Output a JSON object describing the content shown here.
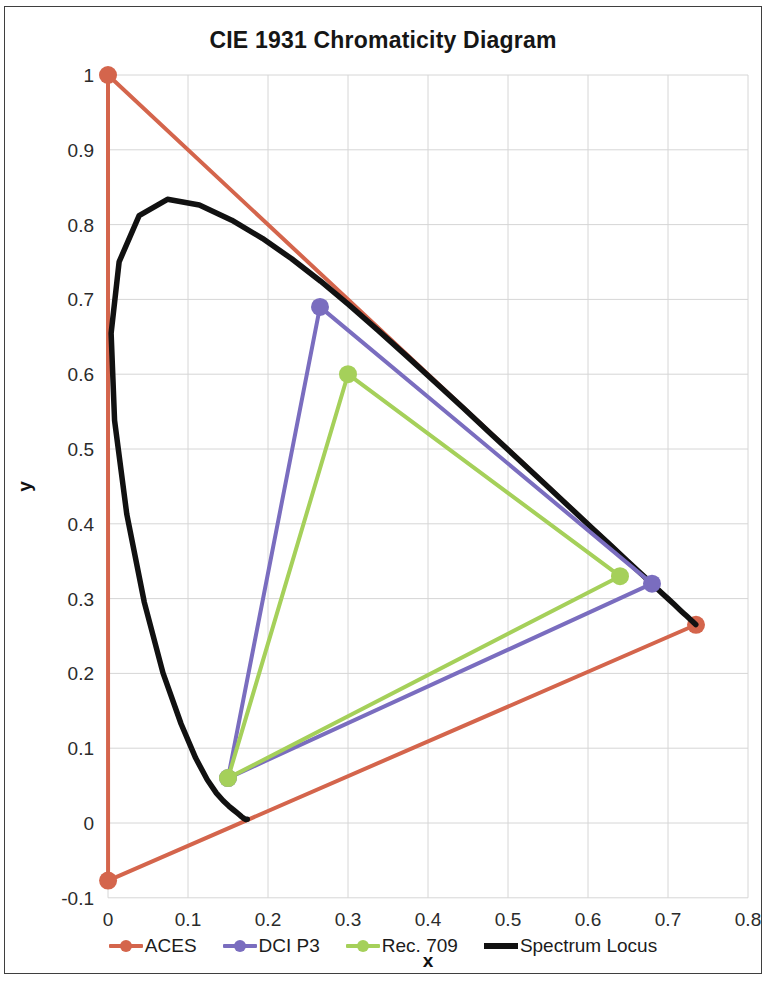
{
  "chart_data": {
    "type": "line",
    "title": "CIE 1931 Chromaticity Diagram",
    "xlabel": "x",
    "ylabel": "y",
    "xlim": [
      0,
      0.8
    ],
    "ylim": [
      -0.1,
      1.0
    ],
    "xticks": [
      "0",
      "0.1",
      "0.2",
      "0.3",
      "0.4",
      "0.5",
      "0.6",
      "0.7",
      "0.8"
    ],
    "yticks": [
      "-0.1",
      "0",
      "0.1",
      "0.2",
      "0.3",
      "0.4",
      "0.5",
      "0.6",
      "0.7",
      "0.8",
      "0.9",
      "1"
    ],
    "xtick_values": [
      0,
      0.1,
      0.2,
      0.3,
      0.4,
      0.5,
      0.6,
      0.7,
      0.8
    ],
    "ytick_values": [
      -0.1,
      0,
      0.1,
      0.2,
      0.3,
      0.4,
      0.5,
      0.6,
      0.7,
      0.8,
      0.9,
      1
    ],
    "grid": true,
    "legend_position": "bottom",
    "series": [
      {
        "name": "ACES",
        "color": "#D4654C",
        "marker": "circle",
        "closed": true,
        "points": [
          {
            "label": "red",
            "x": 0.735,
            "y": 0.265
          },
          {
            "label": "green",
            "x": 0.0,
            "y": 1.0
          },
          {
            "label": "blue",
            "x": 0.0001,
            "y": -0.077
          }
        ]
      },
      {
        "name": "DCI P3",
        "color": "#7A6DBF",
        "marker": "circle",
        "closed": true,
        "points": [
          {
            "label": "red",
            "x": 0.68,
            "y": 0.32
          },
          {
            "label": "green",
            "x": 0.265,
            "y": 0.69
          },
          {
            "label": "blue",
            "x": 0.15,
            "y": 0.06
          }
        ]
      },
      {
        "name": "Rec. 709",
        "color": "#A5D05A",
        "marker": "circle",
        "closed": true,
        "points": [
          {
            "label": "red",
            "x": 0.64,
            "y": 0.33
          },
          {
            "label": "green",
            "x": 0.3,
            "y": 0.6
          },
          {
            "label": "blue",
            "x": 0.15,
            "y": 0.06
          }
        ]
      },
      {
        "name": "Spectrum Locus",
        "color": "#111111",
        "marker": "none",
        "closed": false,
        "points": [
          {
            "x": 0.1741,
            "y": 0.005
          },
          {
            "x": 0.174,
            "y": 0.005
          },
          {
            "x": 0.1738,
            "y": 0.0049
          },
          {
            "x": 0.1736,
            "y": 0.0049
          },
          {
            "x": 0.1733,
            "y": 0.0048
          },
          {
            "x": 0.173,
            "y": 0.0048
          },
          {
            "x": 0.1726,
            "y": 0.0048
          },
          {
            "x": 0.1721,
            "y": 0.0048
          },
          {
            "x": 0.1714,
            "y": 0.0051
          },
          {
            "x": 0.1703,
            "y": 0.0058
          },
          {
            "x": 0.1689,
            "y": 0.0069
          },
          {
            "x": 0.1669,
            "y": 0.0086
          },
          {
            "x": 0.1644,
            "y": 0.0109
          },
          {
            "x": 0.1611,
            "y": 0.0138
          },
          {
            "x": 0.1566,
            "y": 0.0177
          },
          {
            "x": 0.151,
            "y": 0.0227
          },
          {
            "x": 0.144,
            "y": 0.0297
          },
          {
            "x": 0.1355,
            "y": 0.0399
          },
          {
            "x": 0.1241,
            "y": 0.0578
          },
          {
            "x": 0.1096,
            "y": 0.0868
          },
          {
            "x": 0.0913,
            "y": 0.1327
          },
          {
            "x": 0.0687,
            "y": 0.2007
          },
          {
            "x": 0.0454,
            "y": 0.295
          },
          {
            "x": 0.0235,
            "y": 0.4127
          },
          {
            "x": 0.0082,
            "y": 0.5384
          },
          {
            "x": 0.0039,
            "y": 0.6548
          },
          {
            "x": 0.0139,
            "y": 0.7502
          },
          {
            "x": 0.0389,
            "y": 0.812
          },
          {
            "x": 0.0743,
            "y": 0.8338
          },
          {
            "x": 0.1142,
            "y": 0.8262
          },
          {
            "x": 0.1547,
            "y": 0.8059
          },
          {
            "x": 0.1929,
            "y": 0.7816
          },
          {
            "x": 0.2296,
            "y": 0.7543
          },
          {
            "x": 0.2658,
            "y": 0.7243
          },
          {
            "x": 0.3016,
            "y": 0.6923
          },
          {
            "x": 0.3373,
            "y": 0.6589
          },
          {
            "x": 0.3731,
            "y": 0.6245
          },
          {
            "x": 0.4087,
            "y": 0.5896
          },
          {
            "x": 0.4441,
            "y": 0.5547
          },
          {
            "x": 0.4788,
            "y": 0.5202
          },
          {
            "x": 0.5125,
            "y": 0.4866
          },
          {
            "x": 0.5448,
            "y": 0.4544
          },
          {
            "x": 0.5752,
            "y": 0.4242
          },
          {
            "x": 0.6029,
            "y": 0.3965
          },
          {
            "x": 0.627,
            "y": 0.3725
          },
          {
            "x": 0.6482,
            "y": 0.3514
          },
          {
            "x": 0.6658,
            "y": 0.334
          },
          {
            "x": 0.6801,
            "y": 0.3197
          },
          {
            "x": 0.6915,
            "y": 0.3083
          },
          {
            "x": 0.7006,
            "y": 0.2993
          },
          {
            "x": 0.7079,
            "y": 0.292
          },
          {
            "x": 0.714,
            "y": 0.2859
          },
          {
            "x": 0.719,
            "y": 0.2809
          },
          {
            "x": 0.723,
            "y": 0.277
          },
          {
            "x": 0.726,
            "y": 0.274
          },
          {
            "x": 0.7283,
            "y": 0.2717
          },
          {
            "x": 0.73,
            "y": 0.27
          },
          {
            "x": 0.7311,
            "y": 0.2689
          },
          {
            "x": 0.732,
            "y": 0.268
          },
          {
            "x": 0.7327,
            "y": 0.2673
          },
          {
            "x": 0.7334,
            "y": 0.2666
          },
          {
            "x": 0.734,
            "y": 0.266
          },
          {
            "x": 0.7344,
            "y": 0.2656
          },
          {
            "x": 0.7346,
            "y": 0.2654
          },
          {
            "x": 0.7347,
            "y": 0.2653
          }
        ]
      }
    ]
  },
  "legend": {
    "items": [
      {
        "label": "ACES",
        "color": "#D4654C",
        "style": "line-marker"
      },
      {
        "label": "DCI P3",
        "color": "#7A6DBF",
        "style": "line-marker"
      },
      {
        "label": "Rec. 709",
        "color": "#A5D05A",
        "style": "line-marker"
      },
      {
        "label": "Spectrum Locus",
        "color": "#111111",
        "style": "line"
      }
    ]
  },
  "colors": {
    "aces": "#D4654C",
    "dci_p3": "#7A6DBF",
    "rec709": "#A5D05A",
    "spectrum_locus": "#111111",
    "grid": "#D6D6D6",
    "border": "#3F3F3F"
  }
}
